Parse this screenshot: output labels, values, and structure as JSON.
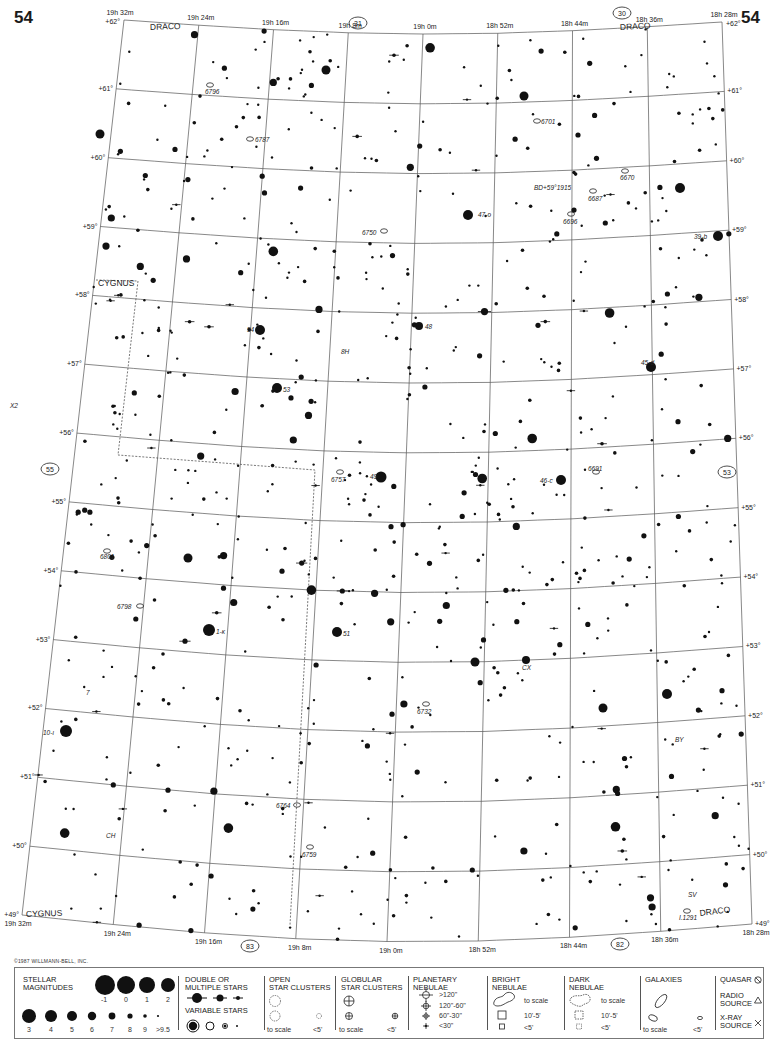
{
  "atlas_page": {
    "page_number": "54",
    "copyright": "©1987 WILLMANN-BELL, INC."
  },
  "map": {
    "ra_labels_top": [
      "19h 32m",
      "19h 24m",
      "19h 16m",
      "19h 8m",
      "19h 0m",
      "18h 52m",
      "18h 44m",
      "18h 36m",
      "18h 28m"
    ],
    "ra_labels_bottom": [
      "19h 32m",
      "19h 24m",
      "19h 16m",
      "19h 8m",
      "19h 0m",
      "18h 52m",
      "18h 44m",
      "18h 36m",
      "18h 28m"
    ],
    "dec_labels_left": [
      "+62°",
      "+61°",
      "+60°",
      "+59°",
      "+58°",
      "+57°",
      "+56°",
      "+55°",
      "+54°",
      "+53°",
      "+52°",
      "+51°",
      "+50°",
      "+49°"
    ],
    "dec_labels_right": [
      "+62°",
      "+61°",
      "+60°",
      "+59°",
      "+58°",
      "+57°",
      "+56°",
      "+55°",
      "+54°",
      "+53°",
      "+52°",
      "+51°",
      "+50°",
      "+49°"
    ],
    "adjacent_charts": {
      "top": "31",
      "top_right": "30",
      "left": "55",
      "right": "53",
      "bottom_left": "83",
      "bottom_right": "82"
    },
    "constellations": [
      "DRACO",
      "DRACO",
      "CYGNUS",
      "CYGNUS",
      "DRACO"
    ],
    "deep_sky_labels": [
      "6796",
      "6787",
      "6701",
      "6670",
      "6687",
      "6696",
      "6750",
      "6757",
      "6691",
      "6801",
      "6798",
      "6732",
      "6764",
      "6759",
      "I.1291"
    ],
    "star_labels": [
      "47-o",
      "39-b",
      "BD+59°1915",
      "54",
      "48",
      "8H",
      "53",
      "45-d",
      "X2",
      "49",
      "46-c",
      "1-κ",
      "51",
      "CX",
      "7",
      "10-ι",
      "BY",
      "CH",
      "SV"
    ]
  },
  "legend": {
    "stellar": {
      "title": "STELLAR\nMAGNITUDES",
      "mags_top": [
        "-1",
        "0",
        "1",
        "2"
      ],
      "mags_bottom": [
        "3",
        "4",
        "5",
        "6",
        "7",
        "8",
        "9",
        ">9.5"
      ]
    },
    "double": {
      "title": "DOUBLE OR\nMULTIPLE STARS"
    },
    "variable": {
      "title": "VARIABLE STARS"
    },
    "open_clusters": {
      "title": "OPEN\nSTAR CLUSTERS",
      "to_scale": "to scale",
      "small": "<5'"
    },
    "globular": {
      "title": "GLOBULAR\nSTAR CLUSTERS",
      "to_scale": "to scale",
      "small": "<5'"
    },
    "planetary": {
      "title": "PLANETARY\nNEBULAE",
      "sizes": [
        ">120\"",
        "120\"-60\"",
        "60\"-30\"",
        "<30\""
      ]
    },
    "bright": {
      "title": "BRIGHT\nNEBULAE",
      "to_scale": "to scale",
      "mid": "10'-5'",
      "small": "<5'"
    },
    "dark": {
      "title": "DARK\nNEBULAE",
      "to_scale": "to scale",
      "mid": "10'-5'",
      "small": "<5'"
    },
    "galaxies": {
      "title": "GALAXIES",
      "to_scale": "to scale",
      "small": "<5'"
    },
    "quasar": {
      "label": "QUASAR"
    },
    "radio": {
      "label": "RADIO\nSOURCE"
    },
    "xray": {
      "label": "X-RAY\nSOURCE"
    }
  }
}
